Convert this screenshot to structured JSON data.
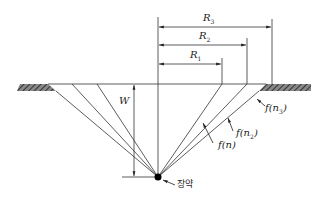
{
  "diagram": {
    "labels": {
      "R3": {
        "main": "R",
        "sub": "3"
      },
      "R2": {
        "main": "R",
        "sub": "2"
      },
      "R1": {
        "main": "R",
        "sub": "1"
      },
      "W": "W",
      "f_n": "f(n)",
      "f_n2": {
        "pre": "f(n",
        "sub": "2",
        "post": ")"
      },
      "f_n3": {
        "pre": "f(n",
        "sub": "3",
        "post": ")"
      },
      "charge": "장약"
    },
    "colors": {
      "line": "#333333",
      "hatch": "#555555",
      "charge": "#000000"
    }
  }
}
